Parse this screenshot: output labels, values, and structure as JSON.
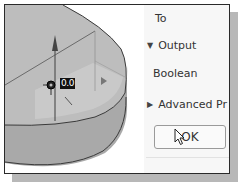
{
  "viewport": {
    "dimension_value": "0.0",
    "colors": {
      "top_face": "#b9b9b9",
      "side_face": "#a8a8a8",
      "edge": "#3a3a3a",
      "arrow": "#555555"
    }
  },
  "panel": {
    "to_label": "To",
    "output_section": {
      "toggle_icon": "triangle-down-icon",
      "label": "Output",
      "expanded": true
    },
    "operation_value": "Boolean",
    "advanced_section": {
      "toggle_icon": "triangle-right-icon",
      "label": "Advanced Pr",
      "expanded": false
    },
    "ok_label": "OK"
  }
}
